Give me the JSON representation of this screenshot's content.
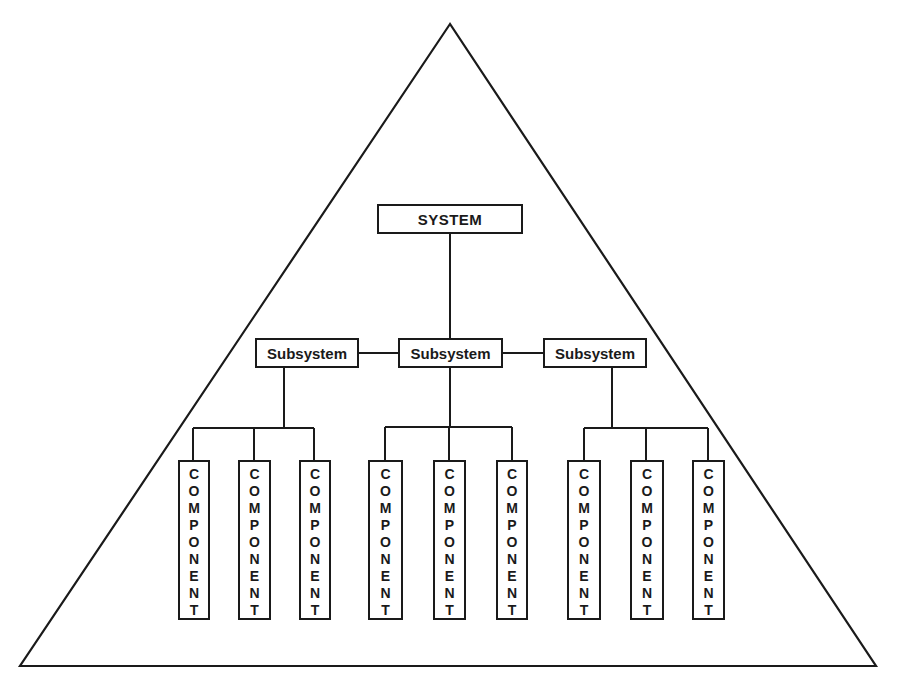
{
  "diagram": {
    "type": "hierarchy-pyramid",
    "outline_shape": "triangle",
    "line_color": "#1a1a1a",
    "background": "#ffffff",
    "system": {
      "label": "SYSTEM"
    },
    "subsystems": [
      {
        "label": "Subsystem",
        "components": [
          "COMPONENT",
          "COMPONENT",
          "COMPONENT"
        ]
      },
      {
        "label": "Subsystem",
        "components": [
          "COMPONENT",
          "COMPONENT",
          "COMPONENT"
        ]
      },
      {
        "label": "Subsystem",
        "components": [
          "COMPONENT",
          "COMPONENT",
          "COMPONENT"
        ]
      }
    ]
  }
}
